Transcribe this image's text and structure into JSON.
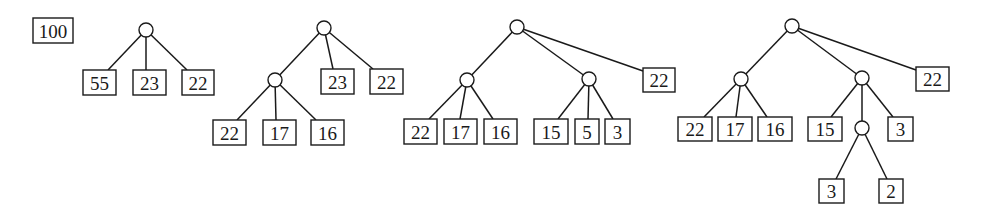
{
  "diagram": {
    "type": "huffman-style tree construction sequence",
    "stages": [
      {
        "id": "stage-0",
        "description": "initial single weight",
        "leaves": [
          {
            "label": "100"
          }
        ]
      },
      {
        "id": "stage-1",
        "description": "root split into three",
        "leaves": [
          {
            "label": "55"
          },
          {
            "label": "23"
          },
          {
            "label": "22"
          }
        ]
      },
      {
        "id": "stage-2",
        "description": "55 split into three",
        "leaves": [
          {
            "label": "22"
          },
          {
            "label": "17"
          },
          {
            "label": "16"
          },
          {
            "label": "23"
          },
          {
            "label": "22"
          }
        ]
      },
      {
        "id": "stage-3",
        "description": "23 split into three",
        "leaves": [
          {
            "label": "22"
          },
          {
            "label": "17"
          },
          {
            "label": "16"
          },
          {
            "label": "15"
          },
          {
            "label": "5"
          },
          {
            "label": "3"
          },
          {
            "label": "22"
          }
        ]
      },
      {
        "id": "stage-4",
        "description": "5 split into two",
        "leaves": [
          {
            "label": "22"
          },
          {
            "label": "17"
          },
          {
            "label": "16"
          },
          {
            "label": "15"
          },
          {
            "label": "3"
          },
          {
            "label": "3"
          },
          {
            "label": "2"
          },
          {
            "label": "22"
          }
        ]
      }
    ]
  },
  "labels": {
    "s0": [
      "100"
    ],
    "s1": [
      "55",
      "23",
      "22"
    ],
    "s2": [
      "22",
      "17",
      "16",
      "23",
      "22"
    ],
    "s3": [
      "22",
      "17",
      "16",
      "15",
      "5",
      "3",
      "22"
    ],
    "s4": [
      "22",
      "17",
      "16",
      "15",
      "3",
      "22",
      "3",
      "2"
    ]
  }
}
